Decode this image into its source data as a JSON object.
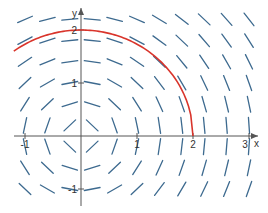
{
  "chart_data": {
    "type": "slope_field",
    "title": "",
    "differential_equation": "dy/dx = -x/y",
    "xlabel": "x",
    "ylabel": "y",
    "xlim": [
      -1.15,
      3.15
    ],
    "ylim": [
      -1.3,
      2.35
    ],
    "x_ticks": [
      -1,
      1,
      2,
      3
    ],
    "y_ticks": [
      -1,
      1,
      2
    ],
    "grid": false,
    "field_grid": {
      "x": [
        -1.0,
        -0.6,
        -0.2,
        0.2,
        0.6,
        1.0,
        1.4,
        1.8,
        2.2,
        2.6,
        3.0
      ],
      "y": [
        -1.0,
        -0.6,
        -0.2,
        0.2,
        0.6,
        1.0,
        1.4,
        1.8,
        2.2
      ]
    },
    "series": [
      {
        "name": "solution curve",
        "kind": "circle arc x^2 + y^2 = 4",
        "radius": 2,
        "x_range": [
          -1.2,
          2.0
        ],
        "color": "#d9342b"
      }
    ],
    "colors": {
      "segments": "#3d6a8f",
      "axes": "#555555",
      "curve": "#d9342b"
    }
  }
}
